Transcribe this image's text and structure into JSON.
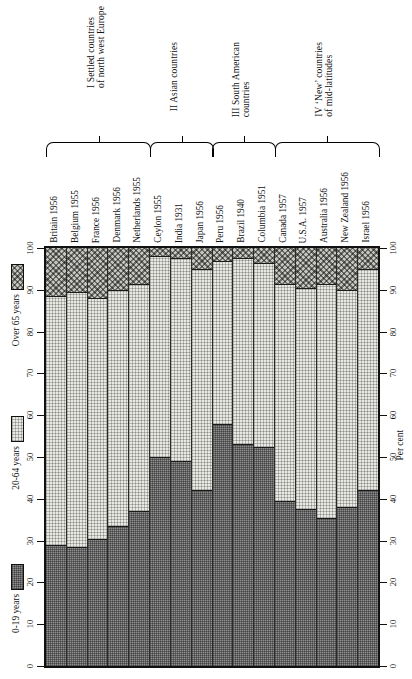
{
  "chart_data": {
    "type": "bar",
    "subtype": "stacked-percentage",
    "title": "",
    "xlabel": "",
    "ylabel": "Per cent",
    "ylim": [
      0,
      100
    ],
    "grid": false,
    "orientation": "vertical-bars-rotated-90",
    "categories": [
      "Britain 1956",
      "Belgium 1955",
      "France 1956",
      "Denmark 1956",
      "Netherlands 1955",
      "Ceylon 1955",
      "India 1931",
      "Japan 1956",
      "Peru 1956",
      "Brazil 1940",
      "Columbia 1951",
      "Canada 1957",
      "U.S.A. 1957",
      "Australia 1956",
      "New Zealand 1956",
      "Israel 1956"
    ],
    "series": [
      {
        "name": "0-19 years",
        "values": [
          29.0,
          28.5,
          30.5,
          33.5,
          37.0,
          50.0,
          49.0,
          42.0,
          58.0,
          53.0,
          52.5,
          39.5,
          37.5,
          35.5,
          38.0,
          42.0
        ]
      },
      {
        "name": "20-64 years",
        "values": [
          59.5,
          61.0,
          57.5,
          56.5,
          54.5,
          48.0,
          48.5,
          53.0,
          39.0,
          44.5,
          44.0,
          52.0,
          53.0,
          56.0,
          52.0,
          53.0
        ]
      },
      {
        "name": "Over 65 years",
        "values": [
          11.5,
          10.5,
          12.0,
          10.0,
          8.5,
          2.0,
          2.5,
          5.0,
          3.0,
          2.5,
          3.5,
          8.5,
          9.5,
          8.5,
          10.0,
          5.0
        ]
      }
    ],
    "y_ticks": [
      0,
      10,
      20,
      30,
      40,
      50,
      60,
      70,
      80,
      90,
      100
    ],
    "y_tick_labels": [
      "0",
      "10",
      "20",
      "30",
      "40",
      "50",
      "60",
      "70",
      "80",
      "90",
      "100"
    ],
    "legend_position": "left-outside"
  },
  "legend": {
    "entries": [
      {
        "label": "Over 65 years",
        "pattern": "cross-hatch",
        "color": "#c6c6c0"
      },
      {
        "label": "20-64 years",
        "pattern": "fine-dots",
        "color": "#e9e9e4"
      },
      {
        "label": "0-19 years",
        "pattern": "dense-dots",
        "color": "#8e8e8e"
      }
    ]
  },
  "groups": [
    {
      "roman": "I",
      "caption": "I Settled countries\nof north west Europe",
      "line1": "I Settled countries",
      "line2": "of north west Europe",
      "count": 5
    },
    {
      "roman": "II",
      "caption": "II Asian countries",
      "line1": "II Asian countries",
      "line2": "",
      "count": 3
    },
    {
      "roman": "III",
      "caption": "III South American countries",
      "line1": "III South American",
      "line2": "countries",
      "count": 3
    },
    {
      "roman": "IV",
      "caption": "IV 'New' countries of mid-latitudes",
      "line1": "IV ‘New’ countries",
      "line2": "of mid-latitudes",
      "count": 5
    }
  ],
  "axes": {
    "left_title": "",
    "right_title": "Per cent",
    "ticks": [
      "0",
      "10",
      "20",
      "30",
      "40",
      "50",
      "60",
      "70",
      "80",
      "90",
      "100"
    ]
  },
  "colors": {
    "young": "#8e8e8e",
    "mid": "#e9e9e4",
    "old": "#c6c6c0",
    "ink": "#111111",
    "paper": "#ffffff"
  }
}
